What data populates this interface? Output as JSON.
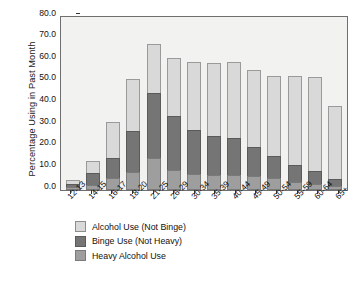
{
  "chart_data": {
    "type": "bar",
    "stacked": true,
    "title": "",
    "xlabel": "",
    "ylabel": "Percentage Using in Past Month",
    "ylim": [
      0,
      80
    ],
    "ytick_step": 10,
    "ytick_labels": [
      "80.0",
      "70.0",
      "60.0",
      "50.0",
      "40.0",
      "30.0",
      "20.0",
      "10.0",
      "0.0"
    ],
    "grid": false,
    "legend_position": "below-axes-left",
    "categories": [
      "12-13",
      "14-15",
      "16-17",
      "18-20",
      "21-25",
      "26-29",
      "30-34",
      "35-39",
      "40-44",
      "45-49",
      "50-54",
      "55-59",
      "60-64",
      "65+"
    ],
    "series": [
      {
        "name": "Heavy Alcohol Use",
        "color": "#9e9e9e",
        "values": [
          1.0,
          2.1,
          5.1,
          8.0,
          14.5,
          9.0,
          7.1,
          6.6,
          6.6,
          6.2,
          5.1,
          3.7,
          2.6,
          1.5
        ]
      },
      {
        "name": "Binge Use (Not Heavy)",
        "color": "#757575",
        "values": [
          1.4,
          5.4,
          9.3,
          19.1,
          30.0,
          24.9,
          20.3,
          18.3,
          17.0,
          13.3,
          10.6,
          7.6,
          6.1,
          3.3
        ]
      },
      {
        "name": "Alcohol Use (Not Binge)",
        "color": "#d9d9d9",
        "values": [
          2.0,
          5.8,
          17.0,
          24.0,
          22.8,
          27.0,
          31.8,
          33.7,
          35.2,
          36.0,
          36.7,
          41.0,
          43.2,
          33.6
        ]
      }
    ],
    "totals": [
      4.4,
      13.3,
      31.4,
      51.1,
      67.3,
      60.9,
      59.2,
      58.6,
      58.8,
      55.5,
      52.4,
      52.3,
      51.9,
      38.4
    ]
  },
  "legend": {
    "items": [
      {
        "label": "Alcohol Use (Not Binge)",
        "swatch": "alcohol"
      },
      {
        "label": "Binge Use (Not Heavy)",
        "swatch": "binge"
      },
      {
        "label": "Heavy Alcohol Use",
        "swatch": "heavy"
      }
    ]
  }
}
